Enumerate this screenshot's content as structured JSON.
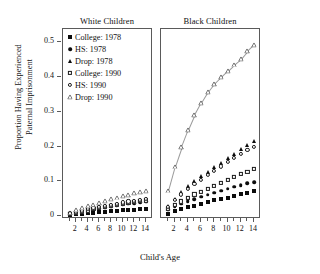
{
  "chart_data": {
    "type": "scatter",
    "title": "",
    "xlabel": "Child's Age",
    "ylabel_line1": "Proportion Having Experienced",
    "ylabel_line2": "Paternal Imprisonment",
    "xlim": [
      1,
      14
    ],
    "ylim": [
      0,
      0.53
    ],
    "yticks": [
      0,
      0.1,
      0.2,
      0.3,
      0.4,
      0.5
    ],
    "ytick_labels": [
      "0",
      "0.1",
      "0.2",
      "0.3",
      "0.4",
      "0.5"
    ],
    "xticks": [
      2,
      4,
      6,
      8,
      10,
      12,
      14
    ],
    "xtick_labels": [
      "2",
      "4",
      "6",
      "8",
      "10",
      "12",
      "14"
    ],
    "minor_xticks": [
      1,
      2,
      3,
      4,
      5,
      6,
      7,
      8,
      9,
      10,
      11,
      12,
      13,
      14
    ],
    "grid": false,
    "legend_position": "top-left-inside-first-panel",
    "x": [
      1,
      2,
      3,
      4,
      5,
      6,
      7,
      8,
      9,
      10,
      11,
      12,
      13,
      14
    ],
    "panels": [
      {
        "name": "White Children",
        "series": [
          {
            "name": "College: 1978",
            "marker": "filled-square",
            "values": [
              0.004,
              0.006,
              0.007,
              0.008,
              0.009,
              0.011,
              0.012,
              0.013,
              0.015,
              0.016,
              0.017,
              0.018,
              0.019,
              0.02
            ]
          },
          {
            "name": "HS: 1978",
            "marker": "filled-circle",
            "values": [
              0.006,
              0.009,
              0.012,
              0.015,
              0.018,
              0.021,
              0.024,
              0.027,
              0.03,
              0.033,
              0.035,
              0.037,
              0.039,
              0.041
            ]
          },
          {
            "name": "Drop: 1978",
            "marker": "filled-triangle",
            "values": [
              0.009,
              0.013,
              0.017,
              0.02,
              0.023,
              0.026,
              0.029,
              0.032,
              0.035,
              0.038,
              0.04,
              0.042,
              0.044,
              0.046
            ]
          },
          {
            "name": "College: 1990",
            "marker": "open-square",
            "values": [
              0.007,
              0.01,
              0.013,
              0.016,
              0.02,
              0.023,
              0.026,
              0.029,
              0.032,
              0.035,
              0.038,
              0.041,
              0.043,
              0.045
            ]
          },
          {
            "name": "HS: 1990",
            "marker": "open-circle",
            "values": [
              0.008,
              0.012,
              0.016,
              0.02,
              0.024,
              0.027,
              0.03,
              0.033,
              0.036,
              0.039,
              0.042,
              0.044,
              0.047,
              0.049
            ]
          },
          {
            "name": "Drop: 1990",
            "marker": "open-triangle",
            "values": [
              0.01,
              0.016,
              0.022,
              0.028,
              0.033,
              0.038,
              0.043,
              0.048,
              0.053,
              0.057,
              0.061,
              0.065,
              0.069,
              0.072
            ]
          }
        ]
      },
      {
        "name": "Black Children",
        "series": [
          {
            "name": "College: 1978",
            "marker": "filled-square",
            "values": [
              0.007,
              0.014,
              0.02,
              0.025,
              0.03,
              0.035,
              0.04,
              0.045,
              0.049,
              0.053,
              0.058,
              0.062,
              0.067,
              0.072
            ]
          },
          {
            "name": "HS: 1978",
            "marker": "filled-circle",
            "values": [
              0.018,
              0.027,
              0.035,
              0.042,
              0.049,
              0.055,
              0.061,
              0.067,
              0.073,
              0.079,
              0.084,
              0.089,
              0.094,
              0.098
            ]
          },
          {
            "name": "Drop: 1978",
            "marker": "filled-triangle",
            "values": [
              0.03,
              0.05,
              0.068,
              0.085,
              0.1,
              0.115,
              0.128,
              0.14,
              0.152,
              0.166,
              0.178,
              0.192,
              0.204,
              0.215
            ]
          },
          {
            "name": "College: 1990",
            "marker": "open-square",
            "values": [
              0.02,
              0.032,
              0.042,
              0.052,
              0.062,
              0.07,
              0.079,
              0.087,
              0.095,
              0.104,
              0.113,
              0.121,
              0.128,
              0.135
            ]
          },
          {
            "name": "HS: 1990",
            "marker": "open-circle",
            "values": [
              0.026,
              0.046,
              0.062,
              0.077,
              0.092,
              0.105,
              0.118,
              0.13,
              0.143,
              0.155,
              0.168,
              0.18,
              0.19,
              0.2
            ]
          },
          {
            "name": "Drop: 1990",
            "marker": "open-triangle",
            "values": [
              0.073,
              0.142,
              0.198,
              0.247,
              0.29,
              0.325,
              0.356,
              0.381,
              0.4,
              0.418,
              0.436,
              0.452,
              0.474,
              0.492
            ],
            "connected": true
          }
        ]
      }
    ],
    "legend": [
      {
        "label": "College: 1978",
        "marker": "filled-square"
      },
      {
        "label": "HS: 1978",
        "marker": "filled-circle"
      },
      {
        "label": "Drop: 1978",
        "marker": "filled-triangle"
      },
      {
        "label": "College: 1990",
        "marker": "open-square"
      },
      {
        "label": "HS: 1990",
        "marker": "open-circle"
      },
      {
        "label": "Drop: 1990",
        "marker": "open-triangle"
      }
    ]
  }
}
